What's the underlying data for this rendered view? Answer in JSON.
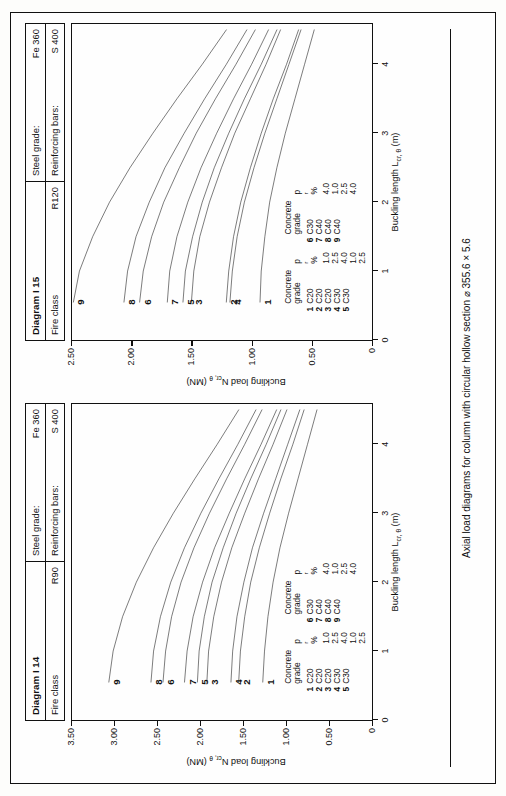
{
  "caption": "Axial load diagrams for column with circular hollow section ⌀ 355.6 × 5.6",
  "diagrams": [
    {
      "title": "Diagram I 14",
      "fire_class_label": "Fire class",
      "fire_class_value": "R90",
      "steel_grade_label": "Steel grade:",
      "steel_grade_value": "Fe 360",
      "rebar_label": "Reinforcing bars:",
      "rebar_value": "S 400",
      "chart_data": {
        "type": "line",
        "title": "Diagram I 14",
        "xlabel": "Buckling length L cr, θ (m)",
        "ylabel": "Buckling load N cr, θ (MN)",
        "xlim": [
          0,
          4.6
        ],
        "ylim": [
          0,
          3.5
        ],
        "xticks": [
          0,
          1,
          2,
          3,
          4
        ],
        "xticklabels": [
          "0",
          "1",
          "2",
          "3",
          "4"
        ],
        "yticks": [
          0,
          0.5,
          1.0,
          1.5,
          2.0,
          2.5,
          3.0,
          3.5
        ],
        "yticklabels": [
          "0",
          "0.50",
          "1.00",
          "1.50",
          "2.00",
          "2.50",
          "3.00",
          "3.50"
        ],
        "grid": false,
        "legend_position": "inside-lower-left",
        "series": [
          {
            "name": "1",
            "concrete_grade": "C20",
            "pr": "1.0",
            "x": [
              0.55,
              1.0,
              1.5,
              2.0,
              2.5,
              3.0,
              3.5,
              4.0,
              4.5
            ],
            "y": [
              1.27,
              1.25,
              1.21,
              1.15,
              1.07,
              0.97,
              0.86,
              0.75,
              0.64
            ]
          },
          {
            "name": "2",
            "concrete_grade": "C20",
            "pr": "2.5",
            "x": [
              0.55,
              1.0,
              1.5,
              2.0,
              2.5,
              3.0,
              3.5,
              4.0,
              4.5
            ],
            "y": [
              1.55,
              1.53,
              1.48,
              1.41,
              1.31,
              1.19,
              1.06,
              0.92,
              0.79
            ]
          },
          {
            "name": "3",
            "concrete_grade": "C20",
            "pr": "4.0",
            "x": [
              0.55,
              1.0,
              1.5,
              2.0,
              2.5,
              3.0,
              3.5,
              4.0,
              4.5
            ],
            "y": [
              1.92,
              1.9,
              1.84,
              1.75,
              1.63,
              1.48,
              1.32,
              1.15,
              0.99
            ]
          },
          {
            "name": "4",
            "concrete_grade": "C30",
            "pr": "1.0",
            "x": [
              0.55,
              1.0,
              1.5,
              2.0,
              2.5,
              3.0,
              3.5,
              4.0,
              4.5
            ],
            "y": [
              1.64,
              1.62,
              1.57,
              1.49,
              1.39,
              1.26,
              1.12,
              0.98,
              0.84
            ]
          },
          {
            "name": "5",
            "concrete_grade": "C30",
            "pr": "2.5",
            "x": [
              0.55,
              1.0,
              1.5,
              2.0,
              2.5,
              3.0,
              3.5,
              4.0,
              4.5
            ],
            "y": [
              2.03,
              2.01,
              1.95,
              1.86,
              1.73,
              1.58,
              1.41,
              1.23,
              1.06
            ]
          },
          {
            "name": "6",
            "concrete_grade": "C30",
            "pr": "4.0",
            "x": [
              0.55,
              1.0,
              1.5,
              2.0,
              2.5,
              3.0,
              3.5,
              4.0,
              4.5
            ],
            "y": [
              2.43,
              2.4,
              2.33,
              2.22,
              2.07,
              1.89,
              1.69,
              1.48,
              1.28
            ]
          },
          {
            "name": "7",
            "concrete_grade": "C40",
            "pr": "1.0",
            "x": [
              0.55,
              1.0,
              1.5,
              2.0,
              2.5,
              3.0,
              3.5,
              4.0,
              4.5
            ],
            "y": [
              2.18,
              2.15,
              2.08,
              1.97,
              1.83,
              1.66,
              1.48,
              1.29,
              1.11
            ]
          },
          {
            "name": "8",
            "concrete_grade": "C40",
            "pr": "2.5",
            "x": [
              0.55,
              1.0,
              1.5,
              2.0,
              2.5,
              3.0,
              3.5,
              4.0,
              4.5
            ],
            "y": [
              2.57,
              2.54,
              2.46,
              2.34,
              2.18,
              1.99,
              1.78,
              1.56,
              1.35
            ]
          },
          {
            "name": "9",
            "concrete_grade": "C40",
            "pr": "4.0",
            "x": [
              0.55,
              1.0,
              1.5,
              2.0,
              2.5,
              3.0,
              3.5,
              4.0,
              4.5
            ],
            "y": [
              3.06,
              3.01,
              2.9,
              2.74,
              2.54,
              2.31,
              2.06,
              1.8,
              1.55
            ]
          }
        ]
      }
    },
    {
      "title": "Diagram I 15",
      "fire_class_label": "Fire class",
      "fire_class_value": "R120",
      "steel_grade_label": "Steel grade:",
      "steel_grade_value": "Fe 360",
      "rebar_label": "Reinforcing bars:",
      "rebar_value": "S 400",
      "chart_data": {
        "type": "line",
        "title": "Diagram I 15",
        "xlabel": "Buckling length L cr, θ (m)",
        "ylabel": "Buckling load N cr, θ (MN)",
        "xlim": [
          0,
          4.6
        ],
        "ylim": [
          0,
          2.5
        ],
        "xticks": [
          0,
          1,
          2,
          3,
          4
        ],
        "xticklabels": [
          "0",
          "1",
          "2",
          "3",
          "4"
        ],
        "yticks": [
          0,
          0.5,
          1.0,
          1.5,
          2.0,
          2.5
        ],
        "yticklabels": [
          "0",
          "0.50",
          "1.00",
          "1.50",
          "2.00",
          "2.50"
        ],
        "grid": false,
        "legend_position": "inside-lower-left",
        "series": [
          {
            "name": "1",
            "concrete_grade": "C20",
            "pr": "1.0",
            "x": [
              0.55,
              1.0,
              1.5,
              2.0,
              2.5,
              3.0,
              3.5,
              4.0,
              4.5
            ],
            "y": [
              0.93,
              0.92,
              0.89,
              0.85,
              0.79,
              0.72,
              0.64,
              0.56,
              0.48
            ]
          },
          {
            "name": "2",
            "concrete_grade": "C20",
            "pr": "2.5",
            "x": [
              0.55,
              1.0,
              1.5,
              2.0,
              2.5,
              3.0,
              3.5,
              4.0,
              4.5
            ],
            "y": [
              1.21,
              1.19,
              1.15,
              1.09,
              1.01,
              0.92,
              0.82,
              0.71,
              0.61
            ]
          },
          {
            "name": "3",
            "concrete_grade": "C20",
            "pr": "4.0",
            "x": [
              0.55,
              1.0,
              1.5,
              2.0,
              2.5,
              3.0,
              3.5,
              4.0,
              4.5
            ],
            "y": [
              1.5,
              1.48,
              1.43,
              1.35,
              1.25,
              1.14,
              1.01,
              0.88,
              0.76
            ]
          },
          {
            "name": "4",
            "concrete_grade": "C30",
            "pr": "1.0",
            "x": [
              0.55,
              1.0,
              1.5,
              2.0,
              2.5,
              3.0,
              3.5,
              4.0,
              4.5
            ],
            "y": [
              1.18,
              1.16,
              1.12,
              1.06,
              0.98,
              0.89,
              0.79,
              0.69,
              0.59
            ]
          },
          {
            "name": "5",
            "concrete_grade": "C30",
            "pr": "2.5",
            "x": [
              0.55,
              1.0,
              1.5,
              2.0,
              2.5,
              3.0,
              3.5,
              4.0,
              4.5
            ],
            "y": [
              1.57,
              1.55,
              1.49,
              1.41,
              1.31,
              1.19,
              1.06,
              0.92,
              0.79
            ]
          },
          {
            "name": "6",
            "concrete_grade": "C30",
            "pr": "4.0",
            "x": [
              0.55,
              1.0,
              1.5,
              2.0,
              2.5,
              3.0,
              3.5,
              4.0,
              4.5
            ],
            "y": [
              1.93,
              1.9,
              1.83,
              1.73,
              1.6,
              1.46,
              1.3,
              1.13,
              0.97
            ]
          },
          {
            "name": "7",
            "concrete_grade": "C40",
            "pr": "1.0",
            "x": [
              0.55,
              1.0,
              1.5,
              2.0,
              2.5,
              3.0,
              3.5,
              4.0,
              4.5
            ],
            "y": [
              1.7,
              1.68,
              1.62,
              1.53,
              1.42,
              1.29,
              1.15,
              1.0,
              0.86
            ]
          },
          {
            "name": "8",
            "concrete_grade": "C40",
            "pr": "2.5",
            "x": [
              0.55,
              1.0,
              1.5,
              2.0,
              2.5,
              3.0,
              3.5,
              4.0,
              4.5
            ],
            "y": [
              2.06,
              2.03,
              1.96,
              1.85,
              1.72,
              1.56,
              1.39,
              1.21,
              1.04
            ]
          },
          {
            "name": "9",
            "concrete_grade": "C40",
            "pr": "4.0",
            "x": [
              0.55,
              1.0,
              1.5,
              2.0,
              2.5,
              3.0,
              3.5,
              4.0,
              4.5
            ],
            "y": [
              2.48,
              2.43,
              2.32,
              2.18,
              2.01,
              1.82,
              1.62,
              1.41,
              1.21
            ]
          }
        ]
      }
    }
  ],
  "legend": {
    "head_num": "",
    "head_grade": "Concrete\ngrade",
    "head_pr": "p r %",
    "rows_left": [
      {
        "n": "1",
        "grade": "C20",
        "pr": "1.0"
      },
      {
        "n": "2",
        "grade": "C20",
        "pr": "2.5"
      },
      {
        "n": "3",
        "grade": "C20",
        "pr": "4.0"
      },
      {
        "n": "4",
        "grade": "C30",
        "pr": "1.0"
      },
      {
        "n": "5",
        "grade": "C30",
        "pr": "2.5"
      }
    ],
    "rows_right": [
      {
        "n": "6",
        "grade": "C30",
        "pr": "4.0"
      },
      {
        "n": "7",
        "grade": "C40",
        "pr": "1.0"
      },
      {
        "n": "8",
        "grade": "C40",
        "pr": "2.5"
      },
      {
        "n": "9",
        "grade": "C40",
        "pr": "4.0"
      }
    ]
  }
}
